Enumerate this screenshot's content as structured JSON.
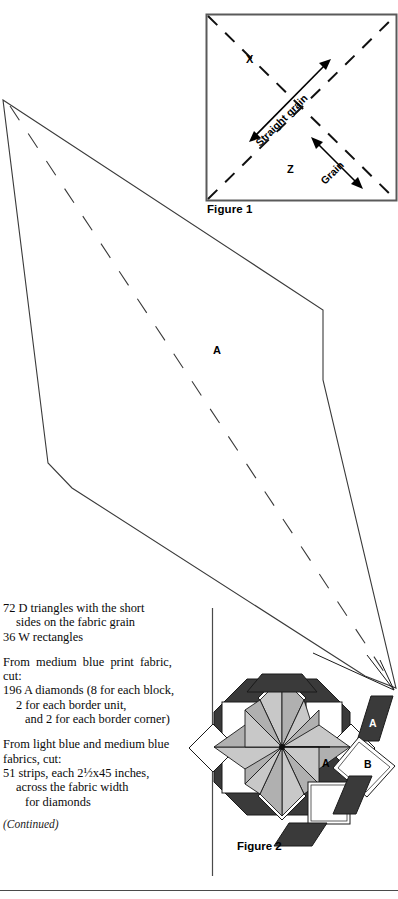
{
  "page": {
    "width": 398,
    "height": 899,
    "background": "#ffffff",
    "ink": "#000000"
  },
  "figure1": {
    "caption": "Figure 1",
    "labels": {
      "x": "X",
      "z": "Z"
    },
    "annotations": {
      "straight_grain": "Straight grain",
      "grain": "Grain"
    },
    "description": "Square block with dashed diagonals, double-headed arrow labeled Straight grain running lower-left to upper-right and a second double-headed arrow labeled Grain running upper-left to lower-right",
    "border_color": "#555555"
  },
  "template_piece": {
    "label": "A",
    "description": "Large elongated diamond template piece with dashed center fold line",
    "outline_color": "#3a3a3a",
    "fill": "#ffffff"
  },
  "instructions": {
    "paragraphs": [
      {
        "lines": [
          {
            "text": "72 D triangles with the short",
            "indent": 0
          },
          {
            "text": "sides on the fabric grain",
            "indent": 1
          },
          {
            "text": "36 W rectangles",
            "indent": 0
          }
        ]
      },
      {
        "lines": [
          {
            "text": "From medium blue print fabric,",
            "indent": 0,
            "justify": true
          },
          {
            "text": "cut:",
            "indent": 0
          },
          {
            "text": "196 A diamonds (8 for each block,",
            "indent": 0
          },
          {
            "text": "2 for each border unit,",
            "indent": 1
          },
          {
            "text": "and 2 for each border corner)",
            "indent": 1
          }
        ]
      },
      {
        "lines": [
          {
            "text": "From light blue and medium blue",
            "indent": 0
          },
          {
            "text": "fabrics, cut:",
            "indent": 0
          },
          {
            "text": "51 strips, each 2½x45 inches,",
            "indent": 0
          },
          {
            "text": "across the fabric width",
            "indent": 1
          },
          {
            "text": "for diamonds",
            "indent": 1
          }
        ]
      }
    ],
    "continued_note": "(Continued)"
  },
  "figure2": {
    "caption": "Figure 2",
    "labels": {
      "star_center_a": "A",
      "exploded_diamond_a": "A",
      "exploded_square_b": "B"
    },
    "description": "Octagonal eight-pointed LeMoyne star block with shaded diamonds, white corner squares and dark corner triangles; an A diamond and a B square are shown pulled out of the block with leader lines",
    "colors": {
      "dark": "#3a3a3a",
      "mid_shade": "#b4b4b4",
      "light_shade": "#d2d2d2",
      "white": "#ffffff",
      "outline": "#1a1a1a"
    }
  },
  "rules": {
    "column_divider": "vertical rule separating text column from Figure 2",
    "footer_rule": "horizontal rule across the bottom of the page"
  }
}
